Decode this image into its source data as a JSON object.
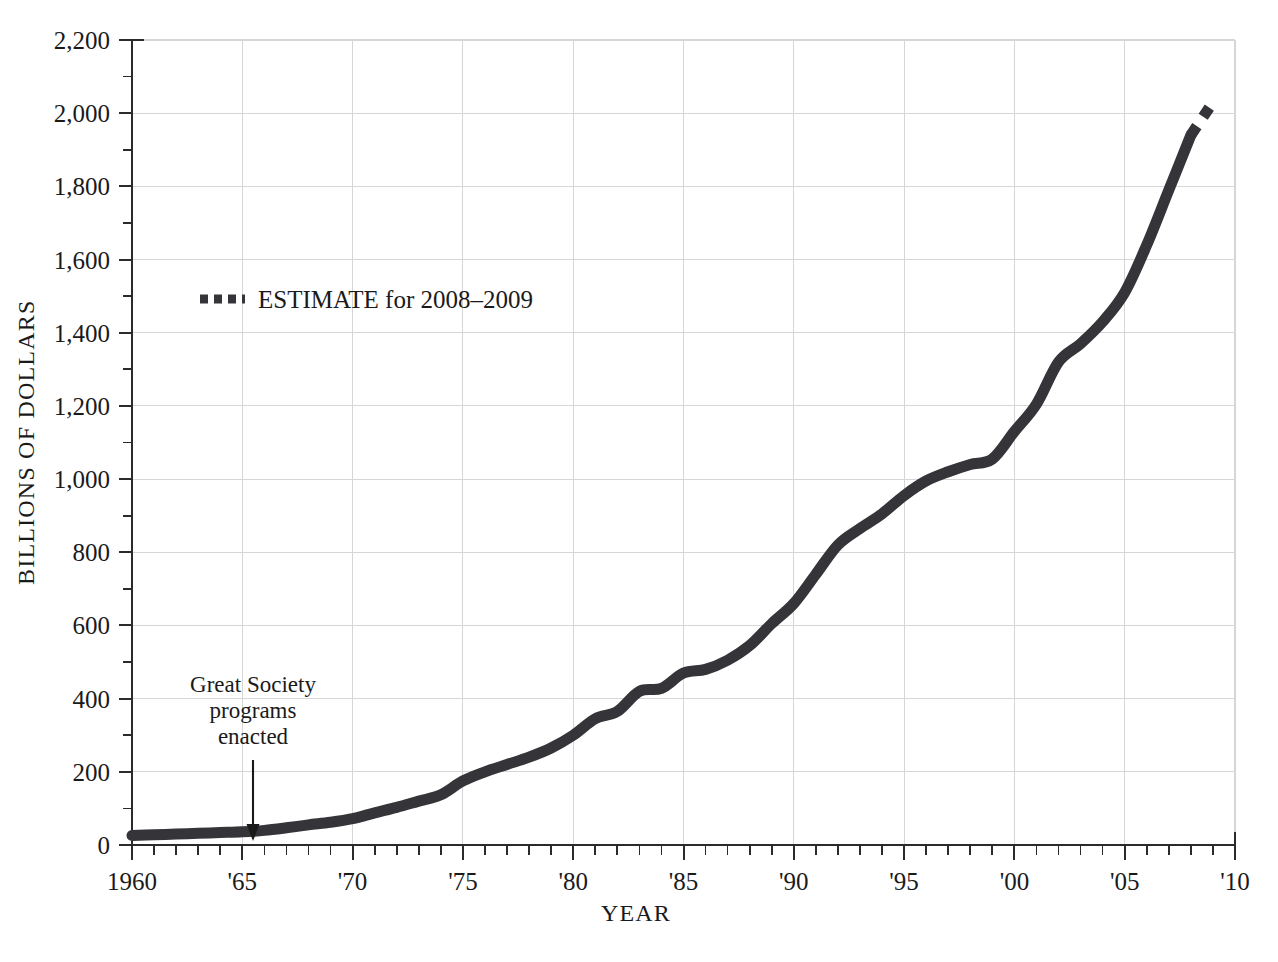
{
  "figure": {
    "bleed_text_above": "",
    "background_color": "#ffffff"
  },
  "axes": {
    "y_title": "BILLIONS OF DOLLARS",
    "x_title": "YEAR",
    "y_ticks": [
      "0",
      "200",
      "400",
      "600",
      "800",
      "1,000",
      "1,200",
      "1,400",
      "1,600",
      "1,800",
      "2,000",
      "2,200"
    ],
    "x_ticks": [
      "1960",
      "'65",
      "'70",
      "'75",
      "'80",
      "'85",
      "'90",
      "'95",
      "'00",
      "'05",
      "'10"
    ]
  },
  "legend": {
    "label": "ESTIMATE for 2008–2009",
    "marker": "dashed-line-swatch"
  },
  "annotation": {
    "line1": "Great Society",
    "line2": "programs",
    "line3": "enacted",
    "arrow": "down-arrow-icon",
    "points_to_year": 1966
  },
  "colors": {
    "series": "#353539",
    "grid": "#d6d6d8",
    "axis": "#2b2b2b",
    "text": "#1a1a1a",
    "background": "#ffffff"
  },
  "chart_data": {
    "type": "line",
    "title": "",
    "xlabel": "YEAR",
    "ylabel": "BILLIONS OF DOLLARS",
    "xlim": [
      1960,
      2010
    ],
    "ylim": [
      0,
      2200
    ],
    "x_tick_values": [
      1960,
      1965,
      1970,
      1975,
      1980,
      1985,
      1990,
      1995,
      2000,
      2005,
      2010
    ],
    "x_tick_labels": [
      "1960",
      "'65",
      "'70",
      "'75",
      "'80",
      "'85",
      "'90",
      "'95",
      "'00",
      "'05",
      "'10"
    ],
    "y_tick_values": [
      0,
      200,
      400,
      600,
      800,
      1000,
      1200,
      1400,
      1600,
      1800,
      2000,
      2200
    ],
    "y_tick_labels": [
      "0",
      "200",
      "400",
      "600",
      "800",
      "1,000",
      "1,200",
      "1,400",
      "1,600",
      "1,800",
      "2,000",
      "2,200"
    ],
    "y_minor_tick_step": 100,
    "x_minor_tick_step": 1,
    "grid": true,
    "grid_axes": "both",
    "legend_position": "inside-upper-left",
    "series": [
      {
        "name": "Actual",
        "style": "solid",
        "x": [
          1960,
          1961,
          1962,
          1963,
          1964,
          1965,
          1966,
          1967,
          1968,
          1969,
          1970,
          1971,
          1972,
          1973,
          1974,
          1975,
          1976,
          1977,
          1978,
          1979,
          1980,
          1981,
          1982,
          1983,
          1984,
          1985,
          1986,
          1987,
          1988,
          1989,
          1990,
          1991,
          1992,
          1993,
          1994,
          1995,
          1996,
          1997,
          1998,
          1999,
          2000,
          2001,
          2002,
          2003,
          2004,
          2005,
          2006,
          2007,
          2008
        ],
        "y": [
          26,
          28,
          30,
          32,
          34,
          36,
          40,
          47,
          55,
          62,
          72,
          88,
          103,
          120,
          137,
          175,
          200,
          220,
          240,
          265,
          300,
          345,
          365,
          420,
          428,
          470,
          480,
          505,
          545,
          605,
          660,
          740,
          820,
          865,
          905,
          955,
          995,
          1020,
          1040,
          1055,
          1130,
          1205,
          1320,
          1370,
          1430,
          1510,
          1640,
          1790,
          1940
        ],
        "units": "billions of dollars"
      },
      {
        "name": "ESTIMATE for 2008–2009",
        "style": "dashed",
        "x": [
          2008,
          2009
        ],
        "y": [
          1940,
          2030
        ],
        "units": "billions of dollars"
      }
    ],
    "annotations": [
      {
        "text": "Great Society programs enacted",
        "x": 1966,
        "y": 40,
        "arrow": true
      }
    ]
  }
}
